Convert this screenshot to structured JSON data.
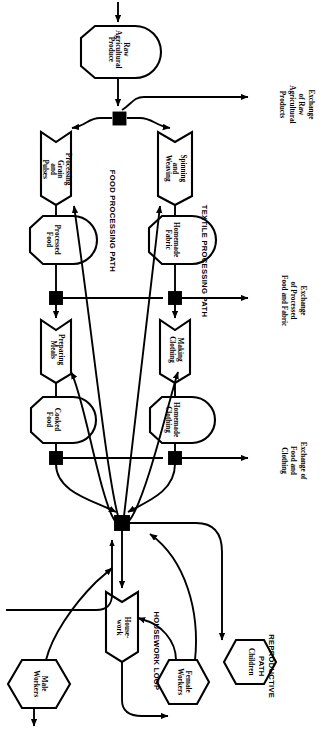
{
  "diagram": {
    "orientation_deg": 90,
    "stroke": "#000000",
    "background": "#ffffff",
    "nodes": [
      {
        "id": "raw_agricultural_produce",
        "label": "Raw\nAgricultural\nProduce",
        "shape": "stock"
      },
      {
        "id": "processing_grain_and_pulses",
        "label": "Processing\nGrain\nand\nPulses",
        "shape": "process"
      },
      {
        "id": "spinning_and_weaving",
        "label": "Spinning\nand\nWeaving",
        "shape": "process"
      },
      {
        "id": "processed_food",
        "label": "Processed\nFood",
        "shape": "stock"
      },
      {
        "id": "homemade_fabric",
        "label": "Homemade\nFabric",
        "shape": "stock"
      },
      {
        "id": "preparing_meals",
        "label": "Preparing\nMeals",
        "shape": "process"
      },
      {
        "id": "making_clothing",
        "label": "Making\nClothing",
        "shape": "process"
      },
      {
        "id": "cooked_food",
        "label": "Cooked\nFood",
        "shape": "stock"
      },
      {
        "id": "homemade_clothing",
        "label": "Homemade\nClothing",
        "shape": "stock"
      },
      {
        "id": "housework",
        "label": "House-\nwork",
        "shape": "process"
      },
      {
        "id": "female_workers",
        "label": "Female\nWorkers",
        "shape": "hexagon"
      },
      {
        "id": "male_workers",
        "label": "Male\nWorkers",
        "shape": "hexagon"
      },
      {
        "id": "children",
        "label": "Children",
        "shape": "hexagon"
      }
    ],
    "path_labels": [
      {
        "id": "food_processing_path",
        "label": "FOOD PROCESSING PATH"
      },
      {
        "id": "textile_processing_path",
        "label": "TEXTILE PROCESSING PATH"
      },
      {
        "id": "housework_loop",
        "label": "HOUSEWORK LOOP"
      },
      {
        "id": "reproductive_path",
        "label": "REPRODUCTIVE\nPATH"
      }
    ],
    "exchange_labels": [
      {
        "id": "exchange_raw",
        "label": "Exchange\nof Raw\nAgricultural\nProducts"
      },
      {
        "id": "exchange_processed",
        "label": "Exchange\nof Processed\nFood and Fabric"
      },
      {
        "id": "exchange_food_clothing",
        "label": "Exchange of\nFood and\nClothing"
      }
    ],
    "junctions": [
      {
        "id": "junction-raw"
      },
      {
        "id": "junction-processed-food"
      },
      {
        "id": "junction-homemade-fabric"
      },
      {
        "id": "junction-cooked-food"
      },
      {
        "id": "junction-homemade-clothing"
      },
      {
        "id": "junction-labor"
      }
    ]
  }
}
